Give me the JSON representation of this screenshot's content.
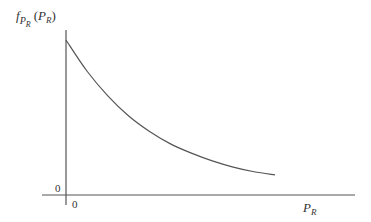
{
  "chart_data": {
    "type": "line",
    "title": "",
    "xlabel": "P_R",
    "ylabel": "f_{P_R}(P_R)",
    "x_tick_labels": [
      "0"
    ],
    "y_tick_labels": [
      "0"
    ],
    "series": [
      {
        "name": "f_{P_R}(P_R)",
        "x": [
          0,
          0.1,
          0.2,
          0.3,
          0.4,
          0.5,
          0.6,
          0.7,
          0.8,
          0.9,
          1.0
        ],
        "values": [
          1.0,
          0.8,
          0.64,
          0.51,
          0.41,
          0.33,
          0.27,
          0.22,
          0.18,
          0.15,
          0.13
        ]
      }
    ],
    "grid": false,
    "legend": null
  },
  "labels": {
    "y_axis_main": "f",
    "y_axis_sub": "P",
    "y_axis_subsub": "R",
    "y_axis_arg_open": "(",
    "y_axis_arg": "P",
    "y_axis_arg_sub": "R",
    "y_axis_arg_close": ")",
    "x_axis_main": "P",
    "x_axis_sub": "R",
    "x_origin": "0",
    "y_origin": "0"
  },
  "colors": {
    "axis": "#555555",
    "curve": "#555555",
    "text": "#333333"
  }
}
